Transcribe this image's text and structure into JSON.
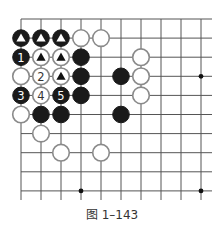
{
  "diagram": {
    "caption": "图 1–143",
    "grid": {
      "x0": 21,
      "dx": 20,
      "cols": 10,
      "y0": 19,
      "dy": 19.1,
      "rows": 10,
      "right_extent": 212,
      "bottom_extent": 200,
      "line_color": "#555555"
    },
    "star_points": [
      {
        "c": 9,
        "r": 3
      },
      {
        "c": 3,
        "r": 9
      },
      {
        "c": 9,
        "r": 9
      }
    ],
    "stones": [
      {
        "c": 0,
        "r": 1,
        "color": "black",
        "mark": "triangle"
      },
      {
        "c": 1,
        "r": 1,
        "color": "black",
        "mark": "triangle"
      },
      {
        "c": 2,
        "r": 1,
        "color": "black",
        "mark": "triangle"
      },
      {
        "c": 3,
        "r": 1,
        "color": "white"
      },
      {
        "c": 4,
        "r": 1,
        "color": "white"
      },
      {
        "c": 0,
        "r": 2,
        "color": "black",
        "label": "1"
      },
      {
        "c": 1,
        "r": 2,
        "color": "white",
        "mark": "triangle"
      },
      {
        "c": 2,
        "r": 2,
        "color": "white",
        "mark": "triangle"
      },
      {
        "c": 3,
        "r": 2,
        "color": "black"
      },
      {
        "c": 6,
        "r": 2,
        "color": "white"
      },
      {
        "c": 0,
        "r": 3,
        "color": "white"
      },
      {
        "c": 1,
        "r": 3,
        "color": "white",
        "label": "2"
      },
      {
        "c": 2,
        "r": 3,
        "color": "white",
        "mark": "triangle"
      },
      {
        "c": 3,
        "r": 3,
        "color": "black"
      },
      {
        "c": 5,
        "r": 3,
        "color": "black"
      },
      {
        "c": 6,
        "r": 3,
        "color": "white"
      },
      {
        "c": 0,
        "r": 4,
        "color": "black",
        "label": "3"
      },
      {
        "c": 1,
        "r": 4,
        "color": "white",
        "label": "4"
      },
      {
        "c": 2,
        "r": 4,
        "color": "black",
        "label": "5"
      },
      {
        "c": 3,
        "r": 4,
        "color": "black"
      },
      {
        "c": 6,
        "r": 4,
        "color": "white"
      },
      {
        "c": 0,
        "r": 5,
        "color": "white"
      },
      {
        "c": 1,
        "r": 5,
        "color": "black"
      },
      {
        "c": 2,
        "r": 5,
        "color": "black"
      },
      {
        "c": 5,
        "r": 5,
        "color": "black"
      },
      {
        "c": 1,
        "r": 6,
        "color": "white"
      },
      {
        "c": 2,
        "r": 7,
        "color": "white"
      },
      {
        "c": 4,
        "r": 7,
        "color": "white"
      }
    ]
  }
}
